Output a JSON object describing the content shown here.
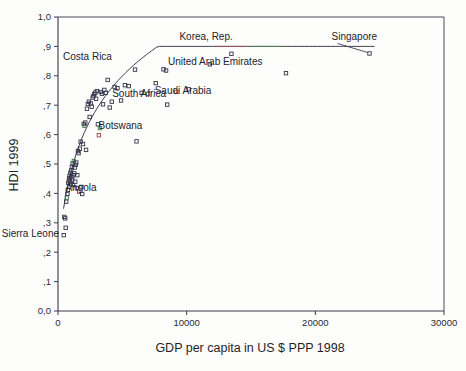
{
  "chart_data": {
    "type": "scatter",
    "title": "",
    "xlabel": "GDP per capita in US $ PPP 1998",
    "ylabel": "HDI 1999",
    "xlim": [
      0,
      30000
    ],
    "ylim": [
      0.0,
      1.0
    ],
    "grid": false,
    "legend": "none",
    "xticks": [
      0,
      10000,
      20000,
      30000
    ],
    "xticklabels": [
      "0",
      "10000",
      "20000",
      "30000"
    ],
    "yticks": [
      0.0,
      0.1,
      0.2,
      0.3,
      0.4,
      0.5,
      0.6,
      0.7,
      0.8,
      0.9,
      1.0
    ],
    "yticklabels": [
      "0,0",
      ",1",
      ",2",
      ",3",
      ",4",
      ",5",
      ",6",
      ",7",
      ",8",
      ",9",
      "1,0"
    ],
    "marker": "open-square",
    "fit_line": {
      "present": true,
      "shape": "logarithmic",
      "description": "fitted logarithmic trend curve rising steeply at low GDP then flattening"
    },
    "annotations": [
      {
        "label": "Korea, Rep.",
        "x": 13478,
        "y": 0.875
      },
      {
        "label": "Singapore",
        "x": 24210,
        "y": 0.876
      },
      {
        "label": "United Arab Emirates",
        "x": 17719,
        "y": 0.809
      },
      {
        "label": "Costa Rica",
        "x": 5987,
        "y": 0.821
      },
      {
        "label": "Saudi Arabia",
        "x": 10158,
        "y": 0.754
      },
      {
        "label": "South Africa",
        "x": 8488,
        "y": 0.702
      },
      {
        "label": "Botswana",
        "x": 6103,
        "y": 0.577
      },
      {
        "label": "Angola",
        "x": 1821,
        "y": 0.422
      },
      {
        "label": "Sierra Leone",
        "x": 448,
        "y": 0.258
      }
    ],
    "points": [
      {
        "x": 448,
        "y": 0.258
      },
      {
        "x": 490,
        "y": 0.32
      },
      {
        "x": 560,
        "y": 0.315
      },
      {
        "x": 600,
        "y": 0.283
      },
      {
        "x": 640,
        "y": 0.372
      },
      {
        "x": 690,
        "y": 0.386
      },
      {
        "x": 730,
        "y": 0.398
      },
      {
        "x": 770,
        "y": 0.412
      },
      {
        "x": 800,
        "y": 0.436
      },
      {
        "x": 840,
        "y": 0.444
      },
      {
        "x": 880,
        "y": 0.452
      },
      {
        "x": 900,
        "y": 0.46
      },
      {
        "x": 930,
        "y": 0.441
      },
      {
        "x": 960,
        "y": 0.47
      },
      {
        "x": 990,
        "y": 0.432
      },
      {
        "x": 1020,
        "y": 0.478
      },
      {
        "x": 1050,
        "y": 0.455
      },
      {
        "x": 1080,
        "y": 0.49
      },
      {
        "x": 1110,
        "y": 0.447
      },
      {
        "x": 1140,
        "y": 0.502
      },
      {
        "x": 1170,
        "y": 0.428
      },
      {
        "x": 1200,
        "y": 0.462
      },
      {
        "x": 1230,
        "y": 0.51
      },
      {
        "x": 1270,
        "y": 0.468
      },
      {
        "x": 1300,
        "y": 0.488
      },
      {
        "x": 1340,
        "y": 0.44
      },
      {
        "x": 1380,
        "y": 0.497
      },
      {
        "x": 1420,
        "y": 0.505
      },
      {
        "x": 1460,
        "y": 0.418
      },
      {
        "x": 1500,
        "y": 0.462
      },
      {
        "x": 1550,
        "y": 0.544
      },
      {
        "x": 1600,
        "y": 0.537
      },
      {
        "x": 1650,
        "y": 0.406
      },
      {
        "x": 1700,
        "y": 0.552
      },
      {
        "x": 1760,
        "y": 0.576
      },
      {
        "x": 1821,
        "y": 0.422
      },
      {
        "x": 1880,
        "y": 0.398
      },
      {
        "x": 1940,
        "y": 0.568
      },
      {
        "x": 2000,
        "y": 0.636
      },
      {
        "x": 2060,
        "y": 0.63
      },
      {
        "x": 2120,
        "y": 0.641
      },
      {
        "x": 2180,
        "y": 0.548
      },
      {
        "x": 2250,
        "y": 0.688
      },
      {
        "x": 2320,
        "y": 0.704
      },
      {
        "x": 2400,
        "y": 0.712
      },
      {
        "x": 2460,
        "y": 0.66
      },
      {
        "x": 2540,
        "y": 0.706
      },
      {
        "x": 2620,
        "y": 0.695
      },
      {
        "x": 2700,
        "y": 0.726
      },
      {
        "x": 2760,
        "y": 0.731
      },
      {
        "x": 2820,
        "y": 0.738
      },
      {
        "x": 2900,
        "y": 0.743
      },
      {
        "x": 2960,
        "y": 0.722
      },
      {
        "x": 3020,
        "y": 0.748
      },
      {
        "x": 3100,
        "y": 0.635
      },
      {
        "x": 3180,
        "y": 0.598
      },
      {
        "x": 3260,
        "y": 0.622
      },
      {
        "x": 3340,
        "y": 0.745
      },
      {
        "x": 3420,
        "y": 0.739
      },
      {
        "x": 3500,
        "y": 0.703
      },
      {
        "x": 3600,
        "y": 0.752
      },
      {
        "x": 3720,
        "y": 0.742
      },
      {
        "x": 3860,
        "y": 0.786
      },
      {
        "x": 4020,
        "y": 0.692
      },
      {
        "x": 4180,
        "y": 0.712
      },
      {
        "x": 4400,
        "y": 0.762
      },
      {
        "x": 4620,
        "y": 0.758
      },
      {
        "x": 4900,
        "y": 0.716
      },
      {
        "x": 5200,
        "y": 0.768
      },
      {
        "x": 5500,
        "y": 0.765
      },
      {
        "x": 5987,
        "y": 0.821
      },
      {
        "x": 6103,
        "y": 0.577
      },
      {
        "x": 6500,
        "y": 0.742
      },
      {
        "x": 7000,
        "y": 0.738
      },
      {
        "x": 7600,
        "y": 0.775
      },
      {
        "x": 8200,
        "y": 0.822
      },
      {
        "x": 8400,
        "y": 0.818
      },
      {
        "x": 8488,
        "y": 0.702
      },
      {
        "x": 9200,
        "y": 0.745
      },
      {
        "x": 10158,
        "y": 0.754
      },
      {
        "x": 11800,
        "y": 0.839
      },
      {
        "x": 13478,
        "y": 0.875
      },
      {
        "x": 17719,
        "y": 0.809
      },
      {
        "x": 24210,
        "y": 0.876
      }
    ]
  }
}
